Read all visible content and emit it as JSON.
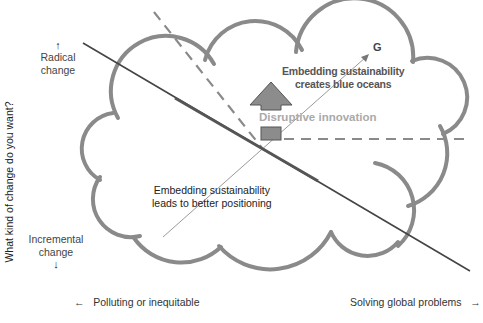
{
  "diagram": {
    "y_axis": {
      "title": "What kind of change do you want?",
      "top_label": "Radical change",
      "top_label_line1": "Radical",
      "top_label_line2": "change",
      "top_arrow_icon": "↑",
      "bottom_label": "Incremental change",
      "bottom_label_line1": "Incremental",
      "bottom_label_line2": "change",
      "bottom_arrow_icon": "↓"
    },
    "x_axis": {
      "left_label": "Polluting or inequitable",
      "left_arrow_icon": "←",
      "right_label": "Solving global problems",
      "right_arrow_icon": "→"
    },
    "annotations": {
      "blue_oceans_line1": "Embedding sustainability",
      "blue_oceans_line2": "creates blue oceans",
      "disruptive": "Disruptive innovation",
      "positioning_line1": "Embedding sustainability",
      "positioning_line2": "leads to better positioning",
      "goal_marker": "G"
    },
    "colors": {
      "cloud_stroke": "#8a8a8a",
      "solid_line": "#444444",
      "dashed_line": "#8a8a8a",
      "thin_arrow": "#9a9a9a",
      "block_arrow_fill": "#8c8c8c",
      "block_arrow_stroke": "#555555",
      "disruptive_text": "#aaaaaa",
      "bold_text": "#555555",
      "body_text": "#333333"
    }
  }
}
